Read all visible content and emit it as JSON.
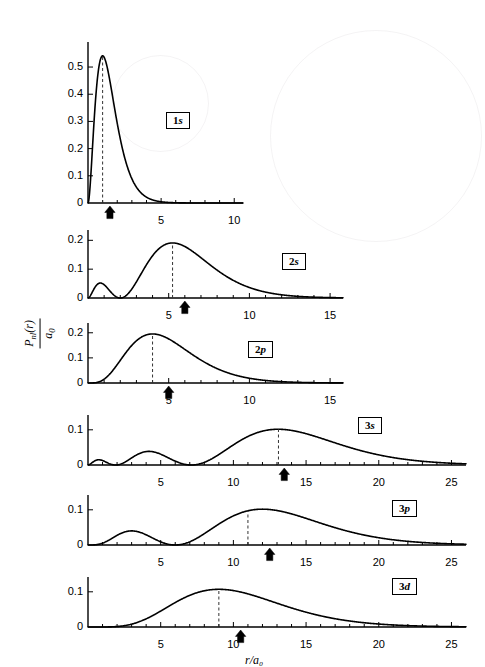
{
  "figure": {
    "axis_label_x": "r/a₀",
    "axis_label_y_numerator": "P",
    "axis_label_y_numerator_sub": "nl",
    "axis_label_y_numerator_arg": "(r)",
    "axis_label_y_denominator": "a",
    "axis_label_y_denominator_sub": "0",
    "line_color": "#000000",
    "dash_color": "#333333",
    "background": "#ffffff"
  },
  "chart_data": [
    {
      "type": "line",
      "name": "1s",
      "title": "1s",
      "xlabel": "r/a0",
      "ylabel": "P_nl(r)/a_0",
      "xlim": [
        0,
        10.6
      ],
      "ylim": [
        0,
        0.57
      ],
      "xticks_major": [
        5,
        10
      ],
      "xtick_labels": [
        "5",
        "10"
      ],
      "xticks_minor_step": 1,
      "yticks": [
        0,
        0.1,
        0.2,
        0.3,
        0.4,
        0.5
      ],
      "ytick_labels": [
        "0",
        "0.1",
        "0.2",
        "0.3",
        "0.4",
        "0.5"
      ],
      "peak_r": 1.0,
      "peak_value": 0.5413,
      "mean_r_arrow": 1.5,
      "dashed_line_r": 1.0,
      "grid": false,
      "x": [
        0,
        0.2,
        0.4,
        0.6,
        0.8,
        1.0,
        1.2,
        1.4,
        1.6,
        1.8,
        2.0,
        2.4,
        2.8,
        3.2,
        3.6,
        4.0,
        4.5,
        5.0,
        5.5,
        6.0,
        7.0,
        8.0,
        9.0,
        10.0
      ],
      "y": [
        0,
        0.1073,
        0.2873,
        0.4337,
        0.5161,
        0.5413,
        0.5232,
        0.4773,
        0.4167,
        0.3504,
        0.2931,
        0.1904,
        0.1173,
        0.069,
        0.0393,
        0.0219,
        0.01,
        0.0045,
        0.002,
        0.0009,
        0.0002,
        0.0,
        0.0,
        0.0
      ]
    },
    {
      "type": "line",
      "name": "2s",
      "title": "2s",
      "xlabel": "r/a0",
      "ylabel": "P_nl(r)/a_0",
      "xlim": [
        0,
        15.8
      ],
      "ylim": [
        0,
        0.215
      ],
      "xticks_major": [
        5,
        10,
        15
      ],
      "xtick_labels": [
        "5",
        "10",
        "15"
      ],
      "xticks_minor_step": 1,
      "yticks": [
        0,
        0.1,
        0.2
      ],
      "ytick_labels": [
        "0",
        "0.1",
        "0.2"
      ],
      "peak_r": 5.24,
      "peak_value": 0.191,
      "secondary_peak_r": 0.76,
      "secondary_peak_value": 0.0459,
      "node_r": 2.0,
      "mean_r_arrow": 6.0,
      "dashed_line_r": 5.24,
      "grid": false
    },
    {
      "type": "line",
      "name": "2p",
      "title": "2p",
      "xlabel": "r/a0",
      "ylabel": "P_nl(r)/a_0",
      "xlim": [
        0,
        15.8
      ],
      "ylim": [
        0,
        0.215
      ],
      "xticks_major": [
        5,
        10,
        15
      ],
      "xtick_labels": [
        "5",
        "10",
        "15"
      ],
      "xticks_minor_step": 1,
      "yticks": [
        0,
        0.1,
        0.2
      ],
      "ytick_labels": [
        "0",
        "0.1",
        "0.2"
      ],
      "peak_r": 4.0,
      "peak_value": 0.1954,
      "mean_r_arrow": 5.0,
      "dashed_line_r": 4.0,
      "grid": false
    },
    {
      "type": "line",
      "name": "3s",
      "title": "3s",
      "xlabel": "r/a0",
      "ylabel": "P_nl(r)/a_0",
      "xlim": [
        0,
        26
      ],
      "ylim": [
        0,
        0.125
      ],
      "xticks_major": [
        5,
        10,
        15,
        20,
        25
      ],
      "xtick_labels": [
        "5",
        "10",
        "15",
        "20",
        "25"
      ],
      "xticks_minor_step": 1,
      "yticks": [
        0,
        0.1
      ],
      "ytick_labels": [
        "0",
        "0.1"
      ],
      "peak_r": 13.1,
      "peak_value": 0.1065,
      "secondary_peaks": [
        {
          "r": 0.74,
          "value": 0.0108
        },
        {
          "r": 4.2,
          "value": 0.05
        }
      ],
      "nodes": [
        1.9,
        7.1
      ],
      "mean_r_arrow": 13.5,
      "dashed_line_r": 13.1,
      "grid": false
    },
    {
      "type": "line",
      "name": "3p",
      "title": "3p",
      "xlabel": "r/a0",
      "ylabel": "P_nl(r)/a_0",
      "xlim": [
        0,
        26
      ],
      "ylim": [
        0,
        0.125
      ],
      "xticks_major": [
        5,
        10,
        15,
        20,
        25
      ],
      "xtick_labels": [
        "5",
        "10",
        "15",
        "20",
        "25"
      ],
      "xticks_minor_step": 1,
      "yticks": [
        0,
        0.1
      ],
      "ytick_labels": [
        "0",
        "0.1"
      ],
      "peak_r": 11.0,
      "peak_value": 0.109,
      "secondary_peaks": [
        {
          "r": 3.0,
          "value": 0.049
        }
      ],
      "nodes": [
        5.6
      ],
      "mean_r_arrow": 12.5,
      "dashed_line_r": 11.0,
      "grid": false
    },
    {
      "type": "line",
      "name": "3d",
      "title": "3d",
      "xlabel": "r/a0",
      "ylabel": "P_nl(r)/a_0",
      "xlim": [
        0,
        26
      ],
      "ylim": [
        0,
        0.125
      ],
      "xticks_major": [
        5,
        10,
        15,
        20,
        25
      ],
      "xtick_labels": [
        "5",
        "10",
        "15",
        "20",
        "25"
      ],
      "xticks_minor_step": 1,
      "yticks": [
        0,
        0.1
      ],
      "ytick_labels": [
        "0",
        "0.1"
      ],
      "peak_r": 9.0,
      "peak_value": 0.1057,
      "mean_r_arrow": 10.5,
      "dashed_line_r": 9.0,
      "grid": false
    }
  ],
  "panels": [
    {
      "label_n": "1",
      "label_l": "s",
      "label_full": "1s"
    },
    {
      "label_n": "2",
      "label_l": "s",
      "label_full": "2s"
    },
    {
      "label_n": "2",
      "label_l": "p",
      "label_full": "2p"
    },
    {
      "label_n": "3",
      "label_l": "s",
      "label_full": "3s"
    },
    {
      "label_n": "3",
      "label_l": "p",
      "label_full": "3p"
    },
    {
      "label_n": "3",
      "label_l": "d",
      "label_full": "3d"
    }
  ]
}
